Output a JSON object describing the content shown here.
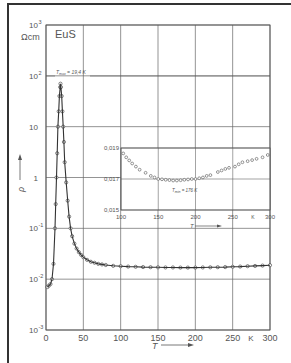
{
  "chart_data": [
    {
      "type": "scatter",
      "title": "EuS",
      "xlabel": "T",
      "x_unit": "K",
      "ylabel": "ρ",
      "y_unit": "Ωcm",
      "yscale": "log",
      "xlim": [
        0,
        300
      ],
      "ylim": [
        0.001,
        1000
      ],
      "grid": true,
      "x_ticks": [
        "0",
        "50",
        "100",
        "150",
        "200",
        "250",
        "300"
      ],
      "y_ticks": [
        "10⁻³",
        "10⁻²",
        "10⁻¹",
        "1",
        "10",
        "10²",
        "10³"
      ],
      "annotation": "T_max = 19.4 K",
      "series": [
        {
          "name": "EuS resistivity",
          "x": [
            2,
            4,
            6,
            8,
            10,
            12,
            13,
            14,
            15,
            16,
            17,
            18,
            19,
            19.4,
            20,
            21,
            22,
            23,
            24,
            25,
            27,
            29,
            31,
            33,
            35,
            38,
            41,
            44,
            47,
            50,
            55,
            60,
            65,
            70,
            75,
            80,
            90,
            100,
            110,
            120,
            130,
            140,
            150,
            160,
            170,
            180,
            190,
            200,
            210,
            220,
            230,
            240,
            250,
            260,
            270,
            280,
            290,
            300
          ],
          "y": [
            0.007,
            0.0075,
            0.008,
            0.01,
            0.02,
            0.1,
            0.3,
            1,
            3,
            10,
            20,
            40,
            60,
            70,
            60,
            40,
            20,
            10,
            5,
            2,
            0.8,
            0.35,
            0.17,
            0.1,
            0.07,
            0.05,
            0.04,
            0.034,
            0.03,
            0.027,
            0.024,
            0.022,
            0.021,
            0.02,
            0.0195,
            0.019,
            0.0183,
            0.018,
            0.0177,
            0.0175,
            0.0173,
            0.0172,
            0.0171,
            0.017,
            0.017,
            0.0169,
            0.0169,
            0.0169,
            0.017,
            0.0171,
            0.0172,
            0.0173,
            0.0175,
            0.0177,
            0.018,
            0.0182,
            0.0185,
            0.0188
          ]
        }
      ]
    },
    {
      "type": "scatter",
      "title": "inset",
      "xlabel": "T",
      "x_unit": "K",
      "ylabel": "",
      "xlim": [
        100,
        300
      ],
      "ylim": [
        0.015,
        0.019
      ],
      "grid": true,
      "x_ticks": [
        "100",
        "150",
        "200",
        "250",
        "300"
      ],
      "y_ticks": [
        "0.015",
        "0.017",
        "0.019"
      ],
      "annotation": "T_min = 176 K",
      "series": [
        {
          "name": "EuS resistivity (linear)",
          "x": [
            103,
            107,
            111,
            115,
            120,
            125,
            133,
            140,
            145,
            150,
            155,
            160,
            165,
            170,
            175,
            180,
            185,
            190,
            195,
            200,
            205,
            210,
            215,
            220,
            230,
            235,
            240,
            245,
            253,
            258,
            263,
            270,
            276,
            282,
            290,
            297
          ],
          "y": [
            0.01865,
            0.0184,
            0.0182,
            0.018,
            0.0178,
            0.0176,
            0.0174,
            0.0172,
            0.0171,
            0.017,
            0.01698,
            0.01695,
            0.01693,
            0.0169,
            0.0169,
            0.01692,
            0.01695,
            0.01697,
            0.017,
            0.017,
            0.01705,
            0.0171,
            0.0172,
            0.01725,
            0.01745,
            0.01755,
            0.01765,
            0.01772,
            0.0178,
            0.01795,
            0.01808,
            0.01815,
            0.01822,
            0.0183,
            0.0184,
            0.01855
          ]
        }
      ]
    }
  ],
  "labels": {
    "material": "EuS",
    "y_unit": "Ωcm",
    "y_symbol": "ρ",
    "x_symbol": "T",
    "x_unit": "K",
    "tmax": "T",
    "tmax_sub": "max",
    "tmax_value": " = 19,4 K",
    "tmin": "T",
    "tmin_sub": "min",
    "tmin_value": " = 176 K"
  },
  "main_axis": {
    "y_tick_labels": [
      "10",
      "10",
      "10",
      "1",
      "10",
      "10",
      "10"
    ],
    "y_tick_exps": [
      "3",
      "2",
      "",
      "",
      "-1",
      "-2",
      "-3"
    ],
    "x_tick_labels": [
      "0",
      "50",
      "100",
      "150",
      "200",
      "250",
      "300"
    ]
  },
  "inset_axis": {
    "y_tick_labels": [
      "0,019",
      "0,017",
      "0,015"
    ],
    "x_tick_labels": [
      "100",
      "150",
      "200",
      "250",
      "300"
    ]
  }
}
